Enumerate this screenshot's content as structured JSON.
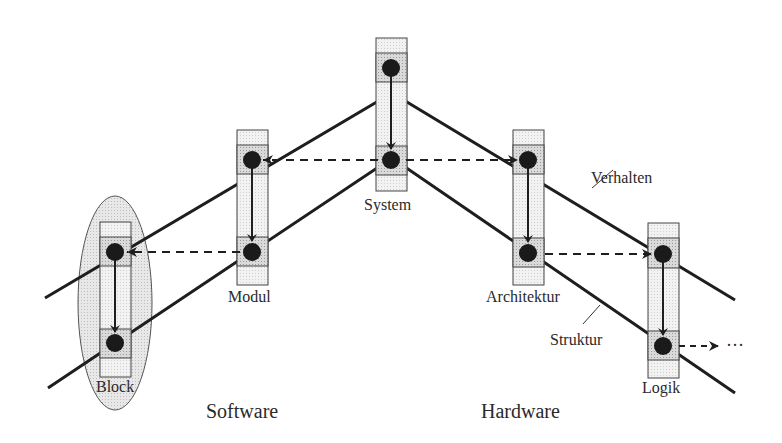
{
  "diagram": {
    "type": "Y-chart-style abstraction levels (Verhalten / Struktur)",
    "domains": {
      "software": "Software",
      "hardware": "Hardware"
    },
    "line_labels": {
      "behavior": "Verhalten",
      "structure": "Struktur"
    },
    "levels": [
      {
        "id": "block",
        "label": "Block",
        "highlighted": true
      },
      {
        "id": "modul",
        "label": "Modul"
      },
      {
        "id": "system",
        "label": "System"
      },
      {
        "id": "architektur",
        "label": "Architektur"
      },
      {
        "id": "logik",
        "label": "Logik"
      }
    ],
    "continuation": "···",
    "colors": {
      "line": "#1e1e1e",
      "box_fill": "#ececec",
      "box_band": "#c8c8c8",
      "dot": "#1a1a1a",
      "ellipse": "#e2e2e2"
    }
  }
}
